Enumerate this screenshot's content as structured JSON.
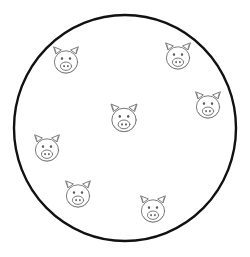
{
  "canvas": {
    "width": 250,
    "height": 257,
    "background_color": "#ffffff",
    "title": "pigs-in-a-circle-counting-illustration"
  },
  "enclosure": {
    "name": "pen-circle",
    "shape": "circle",
    "center_x": 125,
    "center_y": 128,
    "radius_x": 111,
    "radius_y": 113,
    "stroke_color": "#111111",
    "stroke_width": 2.4,
    "fill_color": "#ffffff"
  },
  "pig_style": {
    "stroke_color": "#6e6e6e",
    "stroke_width": 0.9,
    "fill_color": "#ffffff",
    "eye_color": "#5a5a5a",
    "nostril_color": "#5a5a5a"
  },
  "count": {
    "pigs_total": 7,
    "label": "7"
  },
  "pigs": [
    {
      "id": "pig-top-left",
      "cx": 66,
      "cy": 62,
      "scale": 1.0,
      "position_label": "top left"
    },
    {
      "id": "pig-top-right",
      "cx": 178,
      "cy": 58,
      "scale": 1.0,
      "position_label": "top right"
    },
    {
      "id": "pig-right",
      "cx": 208,
      "cy": 107,
      "scale": 1.0,
      "position_label": "right"
    },
    {
      "id": "pig-center",
      "cx": 124,
      "cy": 120,
      "scale": 1.05,
      "position_label": "center"
    },
    {
      "id": "pig-left",
      "cx": 47,
      "cy": 150,
      "scale": 1.0,
      "position_label": "left"
    },
    {
      "id": "pig-bottom-left",
      "cx": 78,
      "cy": 196,
      "scale": 1.0,
      "position_label": "bottom left"
    },
    {
      "id": "pig-bottom-right",
      "cx": 153,
      "cy": 211,
      "scale": 1.0,
      "position_label": "bottom right"
    }
  ]
}
